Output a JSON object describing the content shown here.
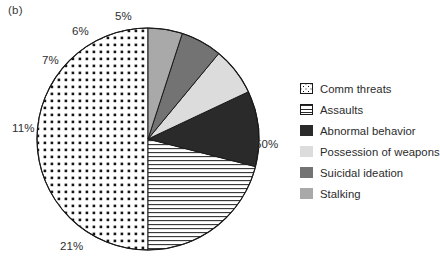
{
  "figure": {
    "panel_label": "(b)",
    "background_color": "#ffffff"
  },
  "chart_data": {
    "type": "pie",
    "title": "",
    "subtitle": "",
    "xlabel": "",
    "ylabel": "",
    "legend_position": "right",
    "grid": false,
    "units": "percent",
    "start_angle_deg": 0,
    "direction": "counterclockwise",
    "categories": [
      "Comm threats",
      "Assaults",
      "Abnormal behavior",
      "Possession of weapons",
      "Suicidal ideation",
      "Stalking"
    ],
    "values": [
      50,
      21,
      11,
      7,
      6,
      5
    ],
    "labels": [
      "50%",
      "21%",
      "11%",
      "7%",
      "6%",
      "5%"
    ],
    "slice_styles": [
      "dotted",
      "horizontal-lines",
      "solid-black",
      "solid-very-light-gray",
      "solid-medium-dark-gray",
      "solid-medium-gray"
    ],
    "slice_colors": [
      "#ffffff",
      "#ffffff",
      "#2a2a2a",
      "#dcdcdc",
      "#737373",
      "#a9a9a9"
    ]
  },
  "pie": {
    "center_x": 148,
    "center_y": 139,
    "radius": 111,
    "outline_color": "#1a1a1a",
    "labels": [
      {
        "text": "50%",
        "x": 255,
        "y": 138
      },
      {
        "text": "21%",
        "x": 60,
        "y": 240
      },
      {
        "text": "11%",
        "x": 12,
        "y": 122
      },
      {
        "text": "7%",
        "x": 42,
        "y": 54
      },
      {
        "text": "6%",
        "x": 72,
        "y": 25
      },
      {
        "text": "5%",
        "x": 115,
        "y": 10
      }
    ]
  },
  "legend": {
    "items": [
      {
        "label": "Comm threats",
        "swatch": "dots-icon"
      },
      {
        "label": "Assaults",
        "swatch": "horizontal-lines-icon"
      },
      {
        "label": "Abnormal behavior",
        "swatch": "solid-black-icon"
      },
      {
        "label": "Possession of weapons",
        "swatch": "solid-very-light-gray-icon"
      },
      {
        "label": "Suicidal ideation",
        "swatch": "solid-medium-dark-gray-icon"
      },
      {
        "label": "Stalking",
        "swatch": "solid-medium-gray-icon"
      }
    ]
  }
}
